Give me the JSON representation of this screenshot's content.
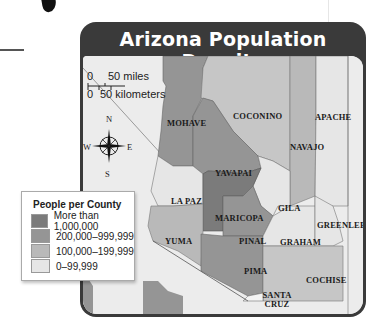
{
  "title": "Arizona Population Density",
  "scale": {
    "miles_zero": "0",
    "miles_label": "50 miles",
    "km_zero": "0",
    "km_label": "50 kilometers"
  },
  "compass": {
    "n": "N",
    "s": "S",
    "e": "E",
    "w": "W"
  },
  "legend": {
    "title": "People per County",
    "items": [
      {
        "label": "More than 1,000,000",
        "color": "#7b7b7b"
      },
      {
        "label": "200,000–999,999",
        "color": "#959595"
      },
      {
        "label": "100,000–199,999",
        "color": "#b9b9b9"
      },
      {
        "label": "0–99,999",
        "color": "#e6e6e6"
      }
    ]
  },
  "counties": [
    {
      "name": "MOHAVE",
      "category": "200,000–999,999"
    },
    {
      "name": "COCONINO",
      "category": "100,000–199,999"
    },
    {
      "name": "APACHE",
      "category": "0–99,999"
    },
    {
      "name": "NAVAJO",
      "category": "100,000–199,999"
    },
    {
      "name": "YAVAPAI",
      "category": "200,000–999,999"
    },
    {
      "name": "LA PAZ",
      "category": "0–99,999"
    },
    {
      "name": "GILA",
      "category": "0–99,999"
    },
    {
      "name": "MARICOPA",
      "category": "More than 1,000,000"
    },
    {
      "name": "GREENLEE",
      "category": "0–99,999"
    },
    {
      "name": "YUMA",
      "category": "200,000–999,999"
    },
    {
      "name": "PINAL",
      "category": "200,000–999,999"
    },
    {
      "name": "GRAHAM",
      "category": "0–99,999"
    },
    {
      "name": "PIMA",
      "category": "200,000–999,999"
    },
    {
      "name": "COCHISE",
      "category": "100,000–199,999"
    },
    {
      "name": "SANTA CRUZ",
      "category": "0–99,999"
    }
  ]
}
